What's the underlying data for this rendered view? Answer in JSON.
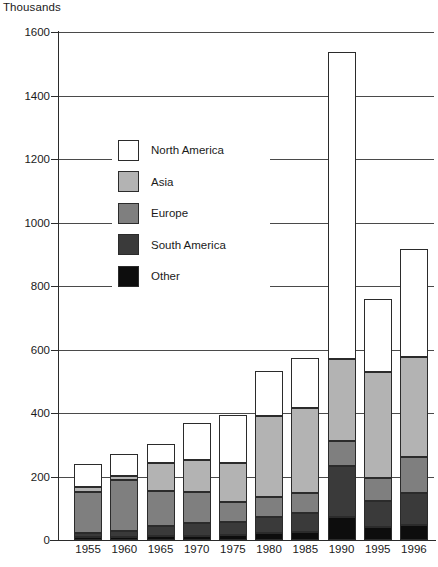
{
  "chart": {
    "type": "bar",
    "unit_caption": "Thousands",
    "axis_label_color": "#1a1a1a"
  },
  "chart_data": {
    "type": "bar",
    "subtype": "stacked-vertical",
    "title": "",
    "subtitle": "",
    "xlabel": "",
    "ylabel": "Thousands",
    "ylim": [
      0,
      1600
    ],
    "yticks": [
      0,
      200,
      400,
      600,
      800,
      1000,
      1200,
      1400,
      1600
    ],
    "ytick_labels": [
      "0",
      "200",
      "400",
      "600",
      "800",
      "1000",
      "1200",
      "1400",
      "1600"
    ],
    "grid": "horizontal",
    "legend_position": "inside-upper-left",
    "categories": [
      "1955",
      "1960",
      "1965",
      "1970",
      "1975",
      "1980",
      "1985",
      "1990",
      "1995",
      "1996"
    ],
    "series": [
      {
        "name": "Other",
        "color": "#0d0d0d",
        "values": [
          8,
          10,
          12,
          14,
          16,
          22,
          26,
          72,
          40,
          48
        ]
      },
      {
        "name": "South America",
        "color": "#3a3a3a",
        "values": [
          14,
          18,
          32,
          40,
          42,
          52,
          58,
          160,
          82,
          100
        ]
      },
      {
        "name": "Europe",
        "color": "#7f7f7f",
        "values": [
          130,
          160,
          112,
          96,
          62,
          60,
          64,
          80,
          72,
          112
        ]
      },
      {
        "name": "Asia",
        "color": "#b3b3b3",
        "values": [
          16,
          14,
          88,
          102,
          122,
          256,
          268,
          258,
          336,
          318
        ]
      },
      {
        "name": "North America",
        "color": "#ffffff",
        "values": [
          70,
          68,
          58,
          118,
          152,
          142,
          156,
          968,
          228,
          340
        ]
      }
    ],
    "totals": [
      238,
      270,
      302,
      370,
      394,
      532,
      572,
      1538,
      758,
      918
    ],
    "legend": [
      {
        "label": "North America",
        "color": "#ffffff"
      },
      {
        "label": "Asia",
        "color": "#b3b3b3"
      },
      {
        "label": "Europe",
        "color": "#7f7f7f"
      },
      {
        "label": "South America",
        "color": "#3a3a3a"
      },
      {
        "label": "Other",
        "color": "#0d0d0d"
      }
    ]
  }
}
